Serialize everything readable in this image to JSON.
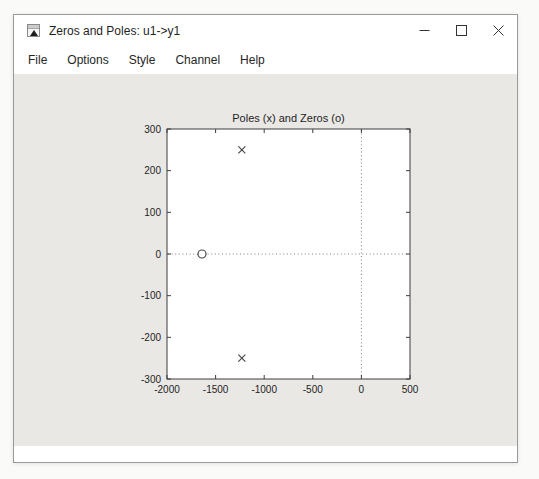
{
  "window": {
    "title": "Zeros and Poles: u1->y1",
    "app_icon": "matlab-plot-window-icon",
    "controls": [
      {
        "name": "minimize",
        "glyph": "–"
      },
      {
        "name": "maximize",
        "glyph": "□"
      },
      {
        "name": "close",
        "glyph": "×"
      }
    ]
  },
  "menu": {
    "items": [
      "File",
      "Options",
      "Style",
      "Channel",
      "Help"
    ]
  },
  "chart_data": {
    "type": "scatter",
    "title": "Poles (x) and Zeros (o)",
    "xlabel": "",
    "ylabel": "",
    "xlim": [
      -2000,
      500
    ],
    "ylim": [
      -300,
      300
    ],
    "x_ticks": [
      -2000,
      -1500,
      -1000,
      -500,
      0,
      500
    ],
    "y_ticks": [
      -300,
      -200,
      -100,
      0,
      100,
      200,
      300
    ],
    "grid": false,
    "legend": "none",
    "reference_lines": {
      "vertical_at": 0,
      "horizontal_at": 0,
      "style": "dotted"
    },
    "series": [
      {
        "name": "Poles",
        "marker": "x",
        "points": [
          [
            -1230,
            250
          ],
          [
            -1230,
            -250
          ]
        ]
      },
      {
        "name": "Zeros",
        "marker": "o",
        "points": [
          [
            -1640,
            0
          ]
        ]
      }
    ],
    "colors": {
      "plot_background": "#ffffff",
      "figure_background": "#e9e8e5",
      "axis": "#3d3d3d",
      "marker": "#474747",
      "reference_line": "#808080",
      "text": "#1e1e1e"
    }
  }
}
